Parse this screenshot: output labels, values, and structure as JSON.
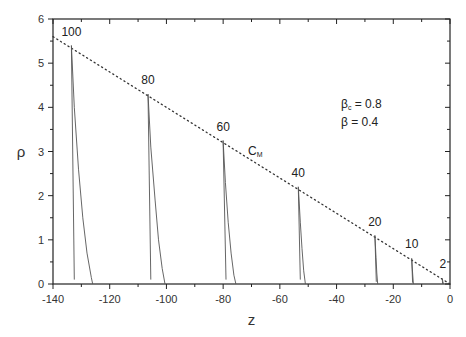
{
  "chart_data": {
    "type": "line",
    "title": "",
    "xlabel": "z",
    "ylabel": "ρ",
    "xlim": [
      -140,
      0
    ],
    "ylim": [
      0,
      6
    ],
    "x_ticks": [
      -140,
      -120,
      -100,
      -80,
      -60,
      -40,
      -20,
      0
    ],
    "y_ticks": [
      0,
      1,
      2,
      3,
      4,
      5,
      6
    ],
    "grid": false,
    "legend": null,
    "parameters": [
      {
        "symbol": "β",
        "subscript": "c",
        "value": "0.8",
        "text": "βc = 0.8"
      },
      {
        "symbol": "β",
        "subscript": "",
        "value": "0.4",
        "text": "β = 0.4"
      }
    ],
    "reference_line": {
      "name": "C_M",
      "label": "C",
      "label_sub": "M",
      "style": "dotted",
      "x": [
        -140,
        0
      ],
      "y": [
        5.6,
        0.0
      ]
    },
    "series": [
      {
        "name": "100",
        "peak": [
          -133.5,
          5.4
        ],
        "left_end": [
          -132.5,
          0.1
        ],
        "zero_cross": -126.0,
        "x": [
          -132.5,
          -133.5,
          -132.5,
          -131,
          -129.5,
          -128,
          -126.5,
          -126
        ],
        "y": [
          0.1,
          5.4,
          4.0,
          2.6,
          1.5,
          0.7,
          0.15,
          0.0
        ]
      },
      {
        "name": "80",
        "peak": [
          -106.5,
          4.3
        ],
        "left_end": [
          -105.5,
          0.1
        ],
        "zero_cross": -100.5,
        "x": [
          -105.5,
          -106.5,
          -105.5,
          -104,
          -102.8,
          -101.5,
          -100.5
        ],
        "y": [
          0.1,
          4.3,
          3.1,
          1.9,
          1.0,
          0.35,
          0.0
        ]
      },
      {
        "name": "60",
        "peak": [
          -80,
          3.25
        ],
        "left_end": [
          -79,
          0.1
        ],
        "zero_cross": -75.5,
        "x": [
          -79,
          -80,
          -79.2,
          -78.2,
          -77.2,
          -76.2,
          -75.5
        ],
        "y": [
          0.1,
          3.25,
          2.3,
          1.4,
          0.7,
          0.2,
          0.0
        ]
      },
      {
        "name": "40",
        "peak": [
          -53.5,
          2.2
        ],
        "left_end": [
          -52.8,
          0.1
        ],
        "zero_cross": -51.0,
        "x": [
          -52.8,
          -53.5,
          -52.8,
          -52.2,
          -51.6,
          -51.0
        ],
        "y": [
          0.1,
          2.2,
          1.4,
          0.8,
          0.3,
          0.0
        ]
      },
      {
        "name": "20",
        "peak": [
          -26.5,
          1.1
        ],
        "left_end": [
          -26.0,
          0.05
        ],
        "zero_cross": -25.5,
        "x": [
          -26.0,
          -26.5,
          -26.1,
          -25.8,
          -25.5
        ],
        "y": [
          0.05,
          1.1,
          0.6,
          0.25,
          0.0
        ]
      },
      {
        "name": "10",
        "peak": [
          -13.5,
          0.58
        ],
        "left_end": [
          -13.2,
          0.03
        ],
        "zero_cross": -12.9,
        "x": [
          -13.2,
          -13.5,
          -13.2,
          -12.9
        ],
        "y": [
          0.03,
          0.58,
          0.25,
          0.0
        ]
      },
      {
        "name": "2",
        "peak": [
          -2.7,
          0.12
        ],
        "left_end": [
          -2.6,
          0.0
        ],
        "zero_cross": -2.3,
        "x": [
          -2.6,
          -2.7,
          -2.5,
          -2.3
        ],
        "y": [
          0.0,
          0.12,
          0.05,
          0.0
        ]
      }
    ],
    "annotations": [
      {
        "text": "100",
        "x": -133.5,
        "y": 5.55
      },
      {
        "text": "80",
        "x": -106.5,
        "y": 4.45
      },
      {
        "text": "60",
        "x": -80,
        "y": 3.4
      },
      {
        "text": "40",
        "x": -53.5,
        "y": 2.35
      },
      {
        "text": "20",
        "x": -26.5,
        "y": 1.25
      },
      {
        "text": "10",
        "x": -13.5,
        "y": 0.75
      },
      {
        "text": "2",
        "x": -2.5,
        "y": 0.3
      }
    ]
  },
  "layout": {
    "plot_left": 53,
    "plot_right": 450,
    "plot_top": 19,
    "plot_bottom": 284,
    "line_color": "#555555",
    "axis_color": "#222222",
    "dot_color": "#333333"
  }
}
